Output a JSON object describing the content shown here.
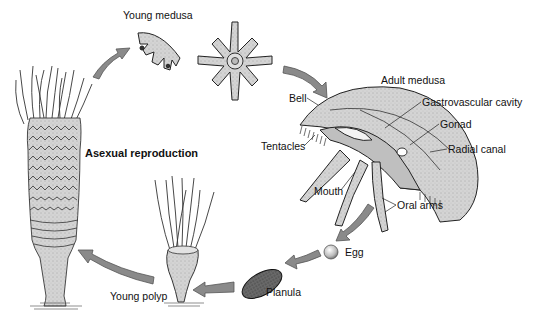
{
  "diagram": {
    "stages": [
      {
        "id": "young-medusa",
        "label": "Young medusa"
      },
      {
        "id": "adult-medusa",
        "label": "Adult medusa"
      },
      {
        "id": "egg",
        "label": "Egg"
      },
      {
        "id": "planula",
        "label": "Planula"
      },
      {
        "id": "young-polyp",
        "label": "Young polyp"
      },
      {
        "id": "strobila",
        "label": "Asexual reproduction"
      }
    ],
    "adult_parts": {
      "bell": "Bell",
      "gastrovascular_cavity": "Gastrovascular cavity",
      "gonad": "Gonad",
      "radial_canal": "Radial canal",
      "tentacles": "Tentacles",
      "mouth": "Mouth",
      "oral_arms": "Oral arms"
    },
    "colors": {
      "arrow_fill": "#8a8a8a",
      "arrow_stroke": "#555555",
      "body_fill": "#d6d6d6",
      "outline": "#222222",
      "background": "#ffffff"
    }
  }
}
